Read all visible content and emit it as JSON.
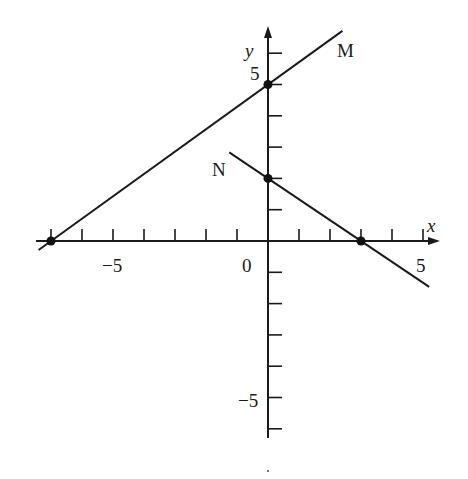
{
  "chart_data": {
    "type": "line",
    "title": "",
    "xlabel": "x",
    "ylabel": "y",
    "xlim": [
      -7.5,
      5.3
    ],
    "ylim": [
      -6.3,
      6.8
    ],
    "grid": false,
    "x_ticks": [
      -7,
      -6,
      -5,
      -4,
      -3,
      -2,
      -1,
      1,
      2,
      3,
      4,
      5
    ],
    "y_ticks": [
      -6,
      -5,
      -4,
      -3,
      -2,
      -1,
      1,
      2,
      3,
      4,
      5,
      6
    ],
    "x_tick_labels": [
      {
        "value": -5,
        "label": "-5"
      },
      {
        "value": 0,
        "label": "0"
      },
      {
        "value": 5,
        "label": "5"
      }
    ],
    "y_tick_labels": [
      {
        "value": 5,
        "label": "5"
      },
      {
        "value": -5,
        "label": "-5"
      }
    ],
    "series": [
      {
        "name": "M",
        "equation": "y = (5/7)x + 5",
        "slope": 0.7143,
        "intercept": 5,
        "x_range": [
          -7.4,
          2.4
        ],
        "points": [
          {
            "x": -7,
            "y": 0
          },
          {
            "x": 0,
            "y": 5
          }
        ]
      },
      {
        "name": "N",
        "equation": "y = -(2/3)x + 2",
        "slope": -0.6667,
        "intercept": 2,
        "x_range": [
          -1.25,
          5.2
        ],
        "points": [
          {
            "x": 0,
            "y": 2
          },
          {
            "x": 3,
            "y": 0
          }
        ]
      }
    ]
  },
  "labels": {
    "x_axis": "x",
    "y_axis": "y",
    "line_m": "M",
    "line_n": "N",
    "origin": "0",
    "x_neg5": "−5",
    "x_pos5": "5",
    "y_pos5": "5",
    "y_neg5": "−5"
  }
}
